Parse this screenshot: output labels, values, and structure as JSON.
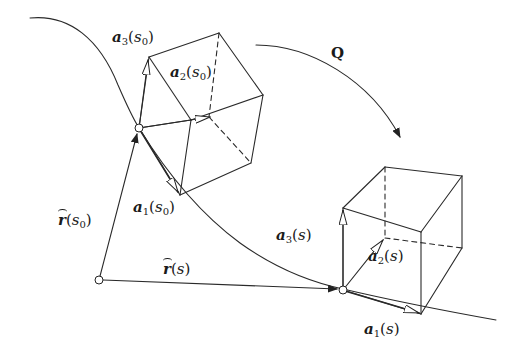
{
  "diagram": {
    "labels": {
      "a3_s0": {
        "vec": "a",
        "sub": "3",
        "arg": "s",
        "argsub": "0"
      },
      "a2_s0": {
        "vec": "a",
        "sub": "2",
        "arg": "s",
        "argsub": "0"
      },
      "a1_s0": {
        "vec": "a",
        "sub": "1",
        "arg": "s",
        "argsub": "0"
      },
      "r_s0": {
        "vec": "r",
        "hat": true,
        "arg": "s",
        "argsub": "0"
      },
      "r_s": {
        "vec": "r",
        "hat": true,
        "arg": "s",
        "argsub": ""
      },
      "Q": "Q",
      "a3_s": {
        "vec": "a",
        "sub": "3",
        "arg": "s",
        "argsub": ""
      },
      "a2_s": {
        "vec": "a",
        "sub": "2",
        "arg": "s",
        "argsub": ""
      },
      "a1_s": {
        "vec": "a",
        "sub": "1",
        "arg": "s",
        "argsub": ""
      }
    },
    "text": {
      "open": "(",
      "close": ")"
    },
    "colors": {
      "stroke": "#2a2a2a",
      "background": "#ffffff"
    }
  }
}
